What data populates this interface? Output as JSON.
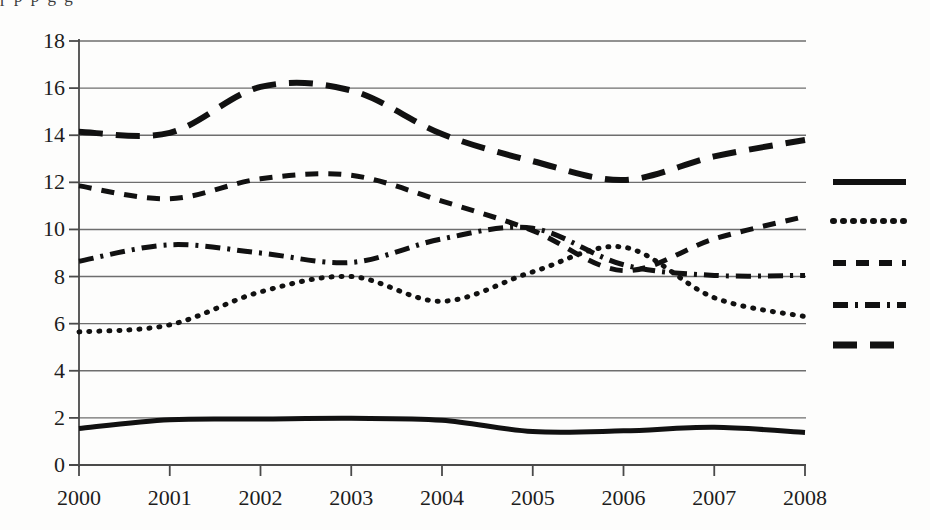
{
  "chart_data": {
    "type": "line",
    "title": "",
    "subtitle": "",
    "xlabel": "",
    "ylabel": "",
    "grid": true,
    "grid_axis": "y",
    "legend_position": "right",
    "legend_labels_visible": false,
    "x": [
      2000,
      2001,
      2002,
      2003,
      2004,
      2005,
      2006,
      2007,
      2008
    ],
    "categories": [
      "2000",
      "2001",
      "2002",
      "2003",
      "2004",
      "2005",
      "2006",
      "2007",
      "2008"
    ],
    "xlim": [
      2000,
      2008
    ],
    "ylim": [
      0,
      18
    ],
    "ytick_labels": [
      "0",
      "2",
      "4",
      "6",
      "8",
      "10",
      "12",
      "14",
      "16",
      "18"
    ],
    "ytick_values": [
      0,
      2,
      4,
      6,
      8,
      10,
      12,
      14,
      16,
      18
    ],
    "ytick_step": 2,
    "line_color": "#111111",
    "grid_color": "#6e6e6e",
    "axis_color": "#4a4a4a",
    "series": [
      {
        "name": "series-1",
        "style": "solid",
        "dash": "none",
        "width": 5,
        "values": [
          1.55,
          1.92,
          1.95,
          1.98,
          1.9,
          1.42,
          1.45,
          1.6,
          1.38
        ]
      },
      {
        "name": "series-2",
        "style": "dotted",
        "dash": "1,9",
        "width": 5,
        "values": [
          5.65,
          5.95,
          7.35,
          8.0,
          6.95,
          8.2,
          9.25,
          7.1,
          6.3
        ]
      },
      {
        "name": "series-3",
        "style": "dashed",
        "dash": "13,10",
        "width": 5,
        "values": [
          11.85,
          11.3,
          12.15,
          12.3,
          11.2,
          9.95,
          8.25,
          9.6,
          10.55
        ]
      },
      {
        "name": "series-4",
        "style": "dashdot",
        "dash": "15,7,3,7",
        "width": 5,
        "values": [
          8.65,
          9.35,
          9.0,
          8.6,
          9.6,
          10.05,
          8.5,
          8.05,
          8.05
        ]
      },
      {
        "name": "series-5",
        "style": "longdash",
        "dash": "24,13",
        "width": 6,
        "values": [
          14.15,
          14.1,
          16.05,
          15.9,
          14.05,
          12.9,
          12.1,
          13.1,
          13.8
        ]
      }
    ]
  },
  "legend": {
    "items": [
      {
        "swatch": "solid-line-swatch",
        "style": "solid",
        "label": ""
      },
      {
        "swatch": "dotted-line-swatch",
        "style": "dotted",
        "label": ""
      },
      {
        "swatch": "dashed-line-swatch",
        "style": "dashed",
        "label": ""
      },
      {
        "swatch": "dashdot-line-swatch",
        "style": "dashdot",
        "label": ""
      },
      {
        "swatch": "longdash-line-swatch",
        "style": "longdash",
        "label": ""
      }
    ]
  },
  "artifacts": {
    "top_bleed_text": "ɼ        p                    p                    g                    g"
  }
}
